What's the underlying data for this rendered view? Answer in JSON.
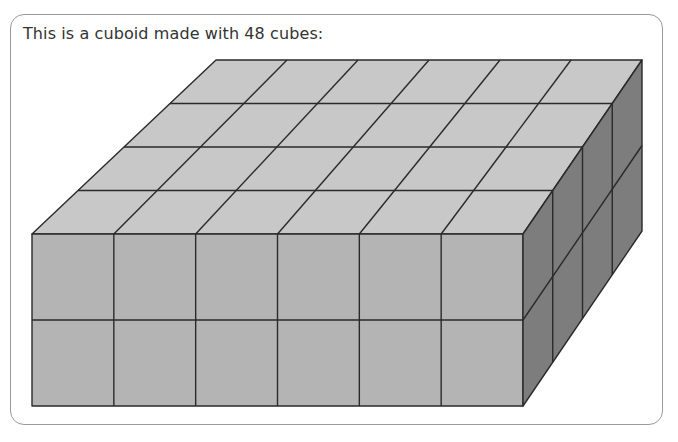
{
  "question": {
    "prompt": "This is a cuboid made with 48 cubes:"
  },
  "cuboid": {
    "total_cubes": 48,
    "length_cubes": 6,
    "depth_cubes": 4,
    "height_cubes": 2,
    "colors": {
      "top": "#c8c8c8",
      "front": "#b4b4b4",
      "side": "#7d7d7d",
      "edge": "#2a2a2a",
      "card_border": "#9a9a9a",
      "text": "#333333"
    }
  }
}
